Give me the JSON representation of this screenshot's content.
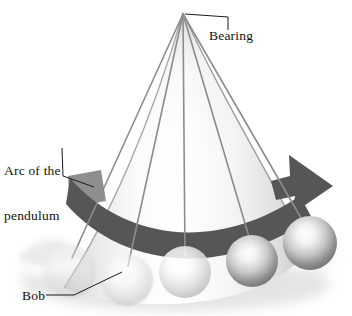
{
  "figure": {
    "background_color": "#ffffff",
    "ink_color": "#111111"
  },
  "labels": {
    "bearing": "Bearing",
    "arc_line1": "Arc of the",
    "arc_line2": "pendulum",
    "bob": "Bob"
  },
  "diagram": {
    "pivot": {
      "name": "bearing-pivot",
      "x": 183,
      "y": 13
    },
    "cone": {
      "name": "swept-cone",
      "fill_light": "#ffffff",
      "fill_shade": "#d8d8d8",
      "edge_color": "#9a9a9a"
    },
    "arc_band": {
      "name": "arc-of-the-pendulum-band",
      "color": "#565656",
      "faded_color": "#8e8e8e",
      "has_arrow_head": true,
      "arrow_direction": "clockwise-right"
    },
    "strings": {
      "count": 5,
      "color": "#8c8c8c",
      "width": 1.6
    },
    "bobs": {
      "count": 5,
      "items": [
        {
          "name": "bob-1",
          "cx": 70,
          "cy": 272,
          "r": 26,
          "opacity": 0.3
        },
        {
          "name": "bob-2",
          "cx": 127,
          "cy": 280,
          "r": 26,
          "opacity": 0.55
        },
        {
          "name": "bob-3",
          "cx": 185,
          "cy": 272,
          "r": 26,
          "opacity": 0.8
        },
        {
          "name": "bob-4",
          "cx": 252,
          "cy": 261,
          "r": 26,
          "opacity": 0.95
        },
        {
          "name": "bob-5",
          "cx": 310,
          "cy": 243,
          "r": 27,
          "opacity": 1.0
        }
      ],
      "highlight_color": "#ffffff",
      "shade_color": "#6f6f6f"
    },
    "ground_shadow": {
      "name": "ground-shadow",
      "color": "#bfbfbf"
    },
    "leader_lines": [
      {
        "name": "leader-bearing",
        "from": "pivot",
        "to": "bearing-label"
      },
      {
        "name": "leader-arc",
        "from": "arc-label",
        "to": "arc-band"
      },
      {
        "name": "leader-bob",
        "from": "bob-label",
        "to": "bob-2"
      }
    ]
  }
}
